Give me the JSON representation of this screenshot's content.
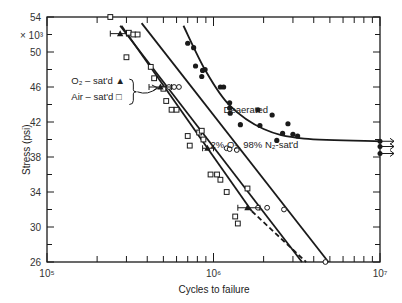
{
  "chart_data": {
    "type": "scatter",
    "title": "",
    "xlabel": "Cycles to failure",
    "ylabel": "Stress (psi)",
    "y_multiplier_label": "× 10³",
    "xscale": "log",
    "xlim": [
      100000,
      10000000
    ],
    "ylim": [
      26,
      54
    ],
    "x_ticks": [
      {
        "value": 100000,
        "label": "10⁵"
      },
      {
        "value": 1000000,
        "label": "10⁶"
      },
      {
        "value": 10000000,
        "label": "10⁷"
      }
    ],
    "y_ticks": [
      {
        "value": 54,
        "label": "54"
      },
      {
        "value": 50,
        "label": "50"
      },
      {
        "value": 46,
        "label": "46"
      },
      {
        "value": 42,
        "label": "42"
      },
      {
        "value": 38,
        "label": "38"
      },
      {
        "value": 34,
        "label": "34"
      },
      {
        "value": 30,
        "label": "30"
      },
      {
        "value": 26,
        "label": "26"
      }
    ],
    "grid": false,
    "annotations": [
      {
        "text": "Deaerated",
        "x": 1150000,
        "y": 43.0
      },
      {
        "text": "2% O₂, 98% N₂-sat'd",
        "x": 960000,
        "y": 39.0
      },
      {
        "text": "O₂ – sat'd ▲",
        "x": 140000,
        "y": 46.4
      },
      {
        "text": "Air – sat'd □",
        "x": 140000,
        "y": 44.5
      }
    ],
    "series": [
      {
        "name": "Deaerated",
        "marker": "filled-circle",
        "points": [
          [
            700000,
            51.0
          ],
          [
            760000,
            50.5
          ],
          [
            780000,
            48.4
          ],
          [
            860000,
            47.9
          ],
          [
            890000,
            48.0
          ],
          [
            850000,
            47.2
          ],
          [
            1100000,
            46.0
          ],
          [
            1150000,
            46.0
          ],
          [
            1250000,
            44.2
          ],
          [
            1250000,
            43.6
          ],
          [
            1260000,
            43.0
          ],
          [
            1450000,
            41.7
          ],
          [
            1850000,
            43.4
          ],
          [
            1900000,
            41.6
          ],
          [
            2250000,
            42.8
          ],
          [
            2600000,
            40.7
          ],
          [
            2800000,
            41.8
          ],
          [
            3000000,
            40.6
          ],
          [
            3200000,
            40.4
          ],
          [
            2400000,
            39.9
          ]
        ],
        "fit_curve": [
          [
            660000,
            53.0
          ],
          [
            900000,
            47.8
          ],
          [
            1250000,
            43.9
          ],
          [
            2000000,
            41.2
          ],
          [
            3500000,
            40.1
          ],
          [
            10000000,
            39.8
          ]
        ],
        "runouts": [
          [
            10000000,
            39.8
          ],
          [
            10000000,
            39.2
          ],
          [
            10000000,
            38.4
          ]
        ]
      },
      {
        "name": "2% O₂, 98% N₂-sat'd",
        "marker": "open-circle",
        "points": [
          [
            540000,
            46.0
          ],
          [
            580000,
            46.0
          ],
          [
            620000,
            46.0
          ],
          [
            1200000,
            39.0
          ],
          [
            1250000,
            38.9
          ],
          [
            1380000,
            38.8
          ],
          [
            1850000,
            32.2
          ],
          [
            2100000,
            32.2
          ],
          [
            2650000,
            32.0
          ],
          [
            4700000,
            26.0
          ]
        ],
        "fit_curve": [
          [
            370000,
            53.3
          ],
          [
            4900000,
            26.0
          ]
        ]
      },
      {
        "name": "Air-sat'd",
        "marker": "open-square",
        "points": [
          [
            240000,
            54.0
          ],
          [
            310000,
            52.2
          ],
          [
            330000,
            52.0
          ],
          [
            350000,
            52.0
          ],
          [
            300000,
            49.4
          ],
          [
            420000,
            48.3
          ],
          [
            440000,
            47.0
          ],
          [
            500000,
            45.8
          ],
          [
            520000,
            44.4
          ],
          [
            560000,
            43.4
          ],
          [
            600000,
            43.4
          ],
          [
            700000,
            40.4
          ],
          [
            720000,
            39.3
          ],
          [
            820000,
            40.8
          ],
          [
            850000,
            41.0
          ],
          [
            870000,
            40.0
          ],
          [
            960000,
            36.0
          ],
          [
            1050000,
            36.0
          ],
          [
            1100000,
            35.4
          ],
          [
            1200000,
            34.0
          ],
          [
            1350000,
            31.2
          ],
          [
            1600000,
            34.4
          ],
          [
            1400000,
            30.4
          ]
        ],
        "fit_curve": [
          [
            280000,
            53.0
          ],
          [
            1700000,
            31.8
          ]
        ],
        "extrapolated_dashed": [
          [
            1700000,
            31.8
          ],
          [
            3600000,
            26.0
          ]
        ]
      },
      {
        "name": "O₂-sat'd",
        "marker": "filled-triangle",
        "points": [
          [
            275000,
            52.1
          ],
          [
            480000,
            46.0
          ],
          [
            920000,
            39.0
          ],
          [
            1600000,
            32.2
          ]
        ],
        "fit_curve": [
          [
            275000,
            53.0
          ],
          [
            3400000,
            26.0
          ]
        ],
        "error_bars_x": [
          {
            "y": 52.1,
            "xmin": 240000,
            "xmax": 300000
          },
          {
            "y": 46.0,
            "xmin": 410000,
            "xmax": 560000
          },
          {
            "y": 39.0,
            "xmin": 860000,
            "xmax": 1000000
          },
          {
            "y": 32.2,
            "xmin": 1400000,
            "xmax": 1900000
          }
        ]
      }
    ]
  }
}
